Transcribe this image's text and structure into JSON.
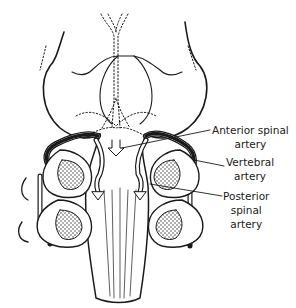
{
  "diagram": {
    "labels": [
      {
        "id": "anterior-spinal-artery",
        "lines": [
          "Anterior spinal",
          "artery"
        ]
      },
      {
        "id": "vertebral-artery",
        "lines": [
          "Vertebral",
          "artery"
        ]
      },
      {
        "id": "posterior-spinal-artery",
        "lines": [
          "Posterior",
          "spinal",
          "artery"
        ]
      }
    ],
    "colors": {
      "line": "#1a1a1a",
      "background": "#ffffff"
    }
  }
}
